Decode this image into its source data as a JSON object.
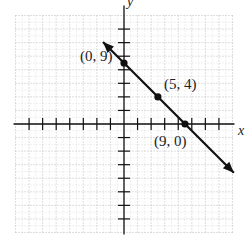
{
  "chart_data": {
    "type": "line",
    "title": "",
    "xlabel": "x",
    "ylabel": "y",
    "xlim": [
      -16,
      16
    ],
    "ylim": [
      -16,
      16
    ],
    "grid": true,
    "grid_major_step": 2,
    "grid_minor_step": 1,
    "tick_step": 2,
    "series": [
      {
        "name": "line",
        "equation": "y = -x + 9",
        "slope": -1,
        "intercept": 9,
        "x_range": [
          -3.1,
          16.2
        ],
        "arrows": "both",
        "color": "#111111"
      }
    ],
    "points": [
      {
        "x": 0,
        "y": 9,
        "label": "(0, 9)"
      },
      {
        "x": 5,
        "y": 4,
        "label": "(5, 4)"
      },
      {
        "x": 9,
        "y": 0,
        "label": "(9, 0)"
      }
    ]
  },
  "colors": {
    "line": "#111111",
    "axis": "#111111",
    "grid": "#b8b8b8"
  }
}
